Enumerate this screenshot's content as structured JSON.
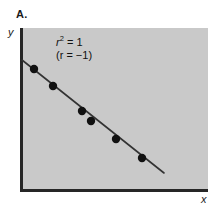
{
  "panel": {
    "label": "A."
  },
  "axes": {
    "x_label": "x",
    "y_label": "y"
  },
  "annotation": {
    "line1_prefix": "r",
    "line1_exponent": "2",
    "line1_suffix": " = 1",
    "line2": "(r = −1)"
  },
  "colors": {
    "plot_background": "#c9c9c9",
    "page_background": "#ffffff",
    "axis": "#262626",
    "point_fill": "#111111",
    "trend_line": "#333333",
    "text": "#1a1a1a"
  },
  "chart_data": {
    "type": "scatter",
    "title": "A.",
    "xlabel": "x",
    "ylabel": "y",
    "grid": false,
    "legend": null,
    "annotations": [
      "r² = 1",
      "(r = −1)"
    ],
    "correlation": -1,
    "r_squared": 1,
    "xlim": [
      0,
      10
    ],
    "ylim": [
      0,
      10
    ],
    "series": [
      {
        "name": "observations",
        "marker": "filled-circle",
        "points_px": [
          {
            "x": 34,
            "y": 69
          },
          {
            "x": 53,
            "y": 86
          },
          {
            "x": 82,
            "y": 111
          },
          {
            "x": 91,
            "y": 121
          },
          {
            "x": 116,
            "y": 139
          },
          {
            "x": 142,
            "y": 158
          }
        ],
        "x": [
          0.7,
          1.7,
          3.2,
          3.7,
          5.0,
          6.4
        ],
        "y": [
          7.5,
          6.4,
          4.9,
          4.3,
          3.2,
          2.0
        ]
      }
    ],
    "trend_line": {
      "type": "linear-fit",
      "slope_sign": "negative",
      "start_px": {
        "x": 22,
        "y": 60
      },
      "end_px": {
        "x": 164,
        "y": 173
      }
    }
  }
}
